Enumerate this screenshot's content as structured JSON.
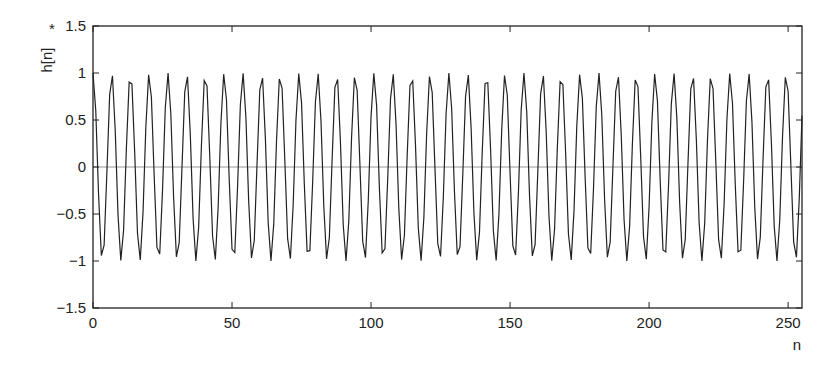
{
  "chart_data": {
    "type": "line",
    "title": "",
    "xlabel": "n",
    "ylabel": "h[n]",
    "ylabel_marker": "*",
    "xlim": [
      0,
      255
    ],
    "ylim": [
      -1.5,
      1.5
    ],
    "grid": false,
    "legend": null,
    "zero_line": true,
    "x_ticks": [
      0,
      50,
      100,
      150,
      200,
      250
    ],
    "x_tick_labels": [
      "0",
      "50",
      "100",
      "150",
      "200",
      "250"
    ],
    "y_ticks": [
      1.5,
      1,
      0.5,
      0,
      -0.5,
      -1,
      -1.5
    ],
    "y_tick_labels": [
      "1.5",
      "1",
      "0.5",
      "0",
      "−0.5",
      "−1",
      "−1.5"
    ],
    "series": [
      {
        "name": "h[n]",
        "description": "sampled sinusoid, amplitude ~1, ~38 cycles over n = 0..255 (about 6.75 samples per period)",
        "model": {
          "amplitude": 1.0,
          "cycles_per_sample": 0.1484,
          "phase": 0.0,
          "n_start": 0,
          "n_end": 255
        },
        "color": "#222222"
      }
    ]
  },
  "colors": {
    "line": "#222222",
    "axis": "#222222",
    "zero_line": "#8a8a8a",
    "background": "#ffffff"
  }
}
